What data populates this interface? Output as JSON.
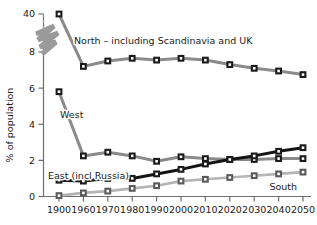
{
  "chart_data": {
    "type": "line",
    "title": "",
    "subtitle": "",
    "xlabel": "",
    "ylabel": "% of population",
    "x": [
      1900,
      1960,
      1970,
      1980,
      1990,
      2000,
      2010,
      2020,
      2030,
      2040,
      2050
    ],
    "xtick_labels": [
      "1900",
      "1960",
      "1970",
      "1980",
      "1990",
      "2000",
      "2010",
      "2020",
      "2030",
      "2040",
      "2050"
    ],
    "ytick_labels": [
      "0",
      "2",
      "4",
      "6",
      "8",
      "40"
    ],
    "ytick_values": [
      0,
      2,
      4,
      6,
      8,
      40
    ],
    "ylim": [
      0,
      8
    ],
    "axis_break": {
      "present": true,
      "between": [
        8,
        40
      ],
      "style": "zigzag",
      "color": "#9a9a9a"
    },
    "grid": false,
    "legend_position": "inline-annotations",
    "marker": "square",
    "series": [
      {
        "name": "North",
        "label": "North  – including Scandinavia and UK",
        "color": "#8a8a8a",
        "marker_color": "#1a1a1a",
        "values": [
          40.0,
          7.2,
          7.5,
          7.65,
          7.55,
          7.65,
          7.55,
          7.3,
          7.1,
          6.95,
          6.75
        ]
      },
      {
        "name": "West",
        "label": "West",
        "color": "#8a8a8a",
        "marker_color": "#1a1a1a",
        "values": [
          5.8,
          2.25,
          2.45,
          2.25,
          1.95,
          2.2,
          2.1,
          2.05,
          2.05,
          2.1,
          2.1
        ]
      },
      {
        "name": "East (incl Russia)",
        "label": "East (incl Russia)",
        "color": "#141414",
        "marker_color": "#1a1a1a",
        "values": [
          0.9,
          0.85,
          1.0,
          1.0,
          1.25,
          1.5,
          1.8,
          2.05,
          2.25,
          2.5,
          2.7
        ]
      },
      {
        "name": "South",
        "label": "South",
        "color": "#b4b4b4",
        "marker_color": "#5a5a5a",
        "values": [
          0.05,
          0.2,
          0.3,
          0.45,
          0.6,
          0.85,
          0.95,
          1.05,
          1.15,
          1.25,
          1.35
        ]
      }
    ],
    "annotations": [
      {
        "text": "North  – including Scandinavia and UK",
        "series": "North"
      },
      {
        "text": "West",
        "series": "West"
      },
      {
        "text": "East (incl Russia)",
        "series": "East (incl Russia)"
      },
      {
        "text": "South",
        "series": "South"
      }
    ]
  },
  "axis": {
    "y_title": "% of population"
  },
  "colors": {
    "north": "#8a8a8a",
    "west": "#8a8a8a",
    "east": "#141414",
    "south": "#b4b4b4",
    "axis": "#6e6e6e",
    "text": "#1a1a1a",
    "background": "#ffffff"
  }
}
